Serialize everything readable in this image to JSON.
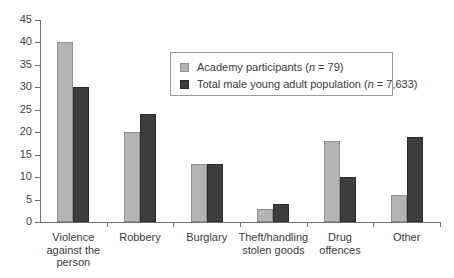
{
  "chart_data": {
    "type": "bar",
    "title": "",
    "xlabel": "",
    "ylabel": "",
    "ylim": [
      0,
      45
    ],
    "ytick_step": 5,
    "grid": false,
    "legend_position": "upper-center-right",
    "categories": [
      "Violence\nagainst the\nperson",
      "Robbery",
      "Burglary",
      "Theft/handling\nstolen goods",
      "Drug\noffences",
      "Other"
    ],
    "ytick_labels": [
      "45",
      "40",
      "35",
      "30",
      "25",
      "20",
      "15",
      "10",
      "5",
      "0"
    ],
    "series": [
      {
        "name": "Academy participants (n = 79)",
        "legend_prefix": "Academy participants (",
        "legend_italic": "n",
        "legend_suffix": " = 79)",
        "color": "#b4b4b4",
        "values": [
          40,
          20,
          13,
          3,
          18,
          6
        ]
      },
      {
        "name": "Total male young adult population (n = 7,633)",
        "legend_prefix": "Total male young adult population (",
        "legend_italic": "n",
        "legend_suffix": " = 7,633)",
        "color": "#3d3d3d",
        "values": [
          30,
          24,
          13,
          4,
          10,
          19
        ]
      }
    ]
  },
  "axis": {
    "line_color": "#6e6e6e"
  }
}
